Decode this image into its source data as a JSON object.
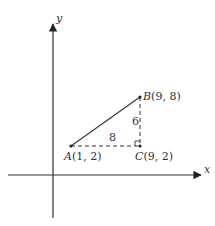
{
  "diagram": {
    "axes": {
      "x_label": "x",
      "y_label": "y"
    },
    "points": {
      "A": {
        "name": "A",
        "coords": "(1, 2)"
      },
      "B": {
        "name": "B",
        "coords": "(9, 8)"
      },
      "C": {
        "name": "C",
        "coords": "(9, 2)"
      }
    },
    "segments": {
      "AC_length": "8",
      "BC_length": "6"
    },
    "colors": {
      "line": "#333333",
      "background": "#ffffff"
    }
  }
}
